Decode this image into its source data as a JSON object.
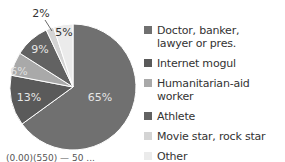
{
  "chart_data": {
    "type": "pie",
    "title": "",
    "categories": [
      "Doctor, banker, lawyer or pres.",
      "Internet mogul",
      "Humanitarian-aid worker",
      "Athlete",
      "Movie star, rock star",
      "Other"
    ],
    "values": [
      65,
      13,
      6,
      9,
      2,
      5
    ],
    "labels": [
      "65%",
      "13%",
      "6%",
      "9%",
      "2%",
      "5%"
    ],
    "colors": [
      "#707070",
      "#5a5a5a",
      "#a9a9a9",
      "#626262",
      "#d4d4d4",
      "#ebebeb"
    ],
    "label_colors": [
      "#e6e6e6",
      "#e6e6e6",
      "#e0e0e0",
      "#e6e6e6",
      "#333333",
      "#333333"
    ],
    "legend_position": "right",
    "start_angle_deg": 0,
    "direction": "clockwise"
  },
  "legend": {
    "items": [
      {
        "label": "Doctor, banker, lawyer or pres.",
        "line1": "Doctor, banker,",
        "line2": "lawyer or pres."
      },
      {
        "label": "Internet mogul"
      },
      {
        "label": "Humanitarian-aid worker"
      },
      {
        "label": "Athlete"
      },
      {
        "label": "Movie star, rock star"
      },
      {
        "label": "Other"
      }
    ]
  },
  "footer": {
    "text": "(0.00)(550) — 50 ..."
  }
}
